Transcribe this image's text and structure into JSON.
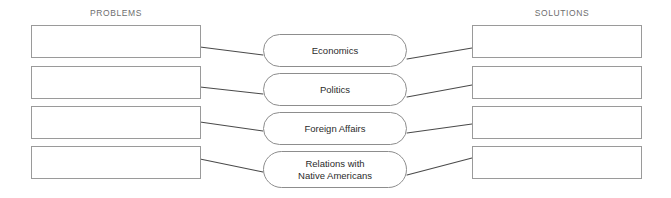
{
  "diagram": {
    "title_hidden": "",
    "background_color": "#ffffff",
    "columns": {
      "left_header": "PROBLEMS",
      "right_header": "SOLUTIONS"
    },
    "center_nodes": [
      {
        "label": "Economics"
      },
      {
        "label": "Politics"
      },
      {
        "label": "Foreign Affairs"
      },
      {
        "label": "Relations with\nNative Americans"
      }
    ],
    "left_boxes": [
      {
        "value": ""
      },
      {
        "value": ""
      },
      {
        "value": ""
      },
      {
        "value": ""
      }
    ],
    "right_boxes": [
      {
        "value": ""
      },
      {
        "value": ""
      },
      {
        "value": ""
      },
      {
        "value": ""
      }
    ],
    "colors": {
      "box_border": "#9a9a9a",
      "pill_border": "#8d8d8d",
      "connector": "#4a4a4a",
      "header_text": "#6e6e6e",
      "label_text": "#2b2b2b"
    }
  }
}
